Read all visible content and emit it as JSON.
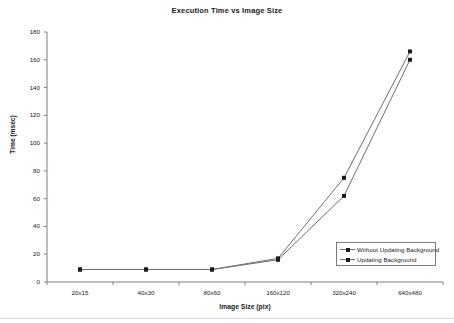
{
  "chart_data": {
    "type": "line",
    "title": "Execution Time vs Image Size",
    "xlabel": "Image Size (pix)",
    "ylabel": "Time (msec)",
    "categories": [
      "20x15",
      "40x30",
      "80x60",
      "160x120",
      "320x240",
      "640x480"
    ],
    "series": [
      {
        "name": "Without Updating Background",
        "marker": "square",
        "values": [
          9,
          9,
          9,
          16,
          62,
          160
        ]
      },
      {
        "name": "Updating Background",
        "marker": "square",
        "values": [
          9,
          9,
          9,
          17,
          75,
          166
        ]
      }
    ],
    "ylim": [
      0,
      180
    ],
    "yticks": [
      0,
      20,
      40,
      60,
      80,
      100,
      120,
      140,
      160,
      180
    ],
    "grid": false,
    "legend_position": "lower-right",
    "line_color": "#6e6e6e",
    "marker_color": "#1a1a1a",
    "axis_color": "#808080"
  }
}
